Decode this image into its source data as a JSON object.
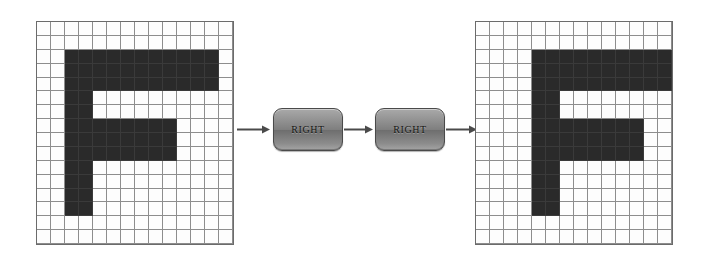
{
  "diagram": {
    "background_color": "#ffffff",
    "cell_on_color": "#2a2a2a",
    "cell_off_color": "#fdfdfd",
    "grid_line_color": "#8d8d8d",
    "grid_border_color": "#6b6b6b",
    "arrow_color": "#4a4a4a"
  },
  "operations": [
    {
      "label": "RIGHT",
      "name": "right-operation-1"
    },
    {
      "label": "RIGHT",
      "name": "right-operation-2"
    }
  ],
  "grids": {
    "input": {
      "name": "input-grid",
      "caption": "",
      "columns": 14,
      "rows": 16,
      "cell_size": 14,
      "filled_cells": [
        [
          2,
          2
        ],
        [
          2,
          3
        ],
        [
          2,
          4
        ],
        [
          2,
          5
        ],
        [
          2,
          6
        ],
        [
          2,
          7
        ],
        [
          2,
          8
        ],
        [
          2,
          9
        ],
        [
          2,
          10
        ],
        [
          2,
          11
        ],
        [
          2,
          12
        ],
        [
          3,
          2
        ],
        [
          3,
          3
        ],
        [
          3,
          4
        ],
        [
          3,
          5
        ],
        [
          3,
          6
        ],
        [
          3,
          7
        ],
        [
          3,
          8
        ],
        [
          3,
          9
        ],
        [
          3,
          10
        ],
        [
          3,
          11
        ],
        [
          3,
          12
        ],
        [
          4,
          2
        ],
        [
          4,
          3
        ],
        [
          4,
          4
        ],
        [
          4,
          5
        ],
        [
          4,
          6
        ],
        [
          4,
          7
        ],
        [
          4,
          8
        ],
        [
          4,
          9
        ],
        [
          4,
          10
        ],
        [
          4,
          11
        ],
        [
          4,
          12
        ],
        [
          5,
          2
        ],
        [
          5,
          3
        ],
        [
          6,
          2
        ],
        [
          6,
          3
        ],
        [
          7,
          2
        ],
        [
          7,
          3
        ],
        [
          7,
          4
        ],
        [
          7,
          5
        ],
        [
          7,
          6
        ],
        [
          7,
          7
        ],
        [
          7,
          8
        ],
        [
          7,
          9
        ],
        [
          8,
          2
        ],
        [
          8,
          3
        ],
        [
          8,
          4
        ],
        [
          8,
          5
        ],
        [
          8,
          6
        ],
        [
          8,
          7
        ],
        [
          8,
          8
        ],
        [
          8,
          9
        ],
        [
          9,
          2
        ],
        [
          9,
          3
        ],
        [
          9,
          4
        ],
        [
          9,
          5
        ],
        [
          9,
          6
        ],
        [
          9,
          7
        ],
        [
          9,
          8
        ],
        [
          9,
          9
        ],
        [
          10,
          2
        ],
        [
          10,
          3
        ],
        [
          11,
          2
        ],
        [
          11,
          3
        ],
        [
          12,
          2
        ],
        [
          12,
          3
        ],
        [
          13,
          2
        ],
        [
          13,
          3
        ]
      ]
    },
    "output": {
      "name": "output-grid",
      "caption": "",
      "columns": 14,
      "rows": 16,
      "cell_size": 14,
      "filled_cells": [
        [
          2,
          4
        ],
        [
          2,
          5
        ],
        [
          2,
          6
        ],
        [
          2,
          7
        ],
        [
          2,
          8
        ],
        [
          2,
          9
        ],
        [
          2,
          10
        ],
        [
          2,
          11
        ],
        [
          2,
          12
        ],
        [
          2,
          13
        ],
        [
          3,
          4
        ],
        [
          3,
          5
        ],
        [
          3,
          6
        ],
        [
          3,
          7
        ],
        [
          3,
          8
        ],
        [
          3,
          9
        ],
        [
          3,
          10
        ],
        [
          3,
          11
        ],
        [
          3,
          12
        ],
        [
          3,
          13
        ],
        [
          4,
          4
        ],
        [
          4,
          5
        ],
        [
          4,
          6
        ],
        [
          4,
          7
        ],
        [
          4,
          8
        ],
        [
          4,
          9
        ],
        [
          4,
          10
        ],
        [
          4,
          11
        ],
        [
          4,
          12
        ],
        [
          4,
          13
        ],
        [
          5,
          4
        ],
        [
          5,
          5
        ],
        [
          6,
          4
        ],
        [
          6,
          5
        ],
        [
          7,
          4
        ],
        [
          7,
          5
        ],
        [
          7,
          6
        ],
        [
          7,
          7
        ],
        [
          7,
          8
        ],
        [
          7,
          9
        ],
        [
          7,
          10
        ],
        [
          7,
          11
        ],
        [
          8,
          4
        ],
        [
          8,
          5
        ],
        [
          8,
          6
        ],
        [
          8,
          7
        ],
        [
          8,
          8
        ],
        [
          8,
          9
        ],
        [
          8,
          10
        ],
        [
          8,
          11
        ],
        [
          9,
          4
        ],
        [
          9,
          5
        ],
        [
          9,
          6
        ],
        [
          9,
          7
        ],
        [
          9,
          8
        ],
        [
          9,
          9
        ],
        [
          9,
          10
        ],
        [
          9,
          11
        ],
        [
          10,
          4
        ],
        [
          10,
          5
        ],
        [
          11,
          4
        ],
        [
          11,
          5
        ],
        [
          12,
          4
        ],
        [
          12,
          5
        ],
        [
          13,
          4
        ],
        [
          13,
          5
        ]
      ]
    }
  },
  "arrows": [
    {
      "name": "arrow-input-to-op1"
    },
    {
      "name": "arrow-op1-to-op2"
    },
    {
      "name": "arrow-op2-to-output"
    }
  ]
}
